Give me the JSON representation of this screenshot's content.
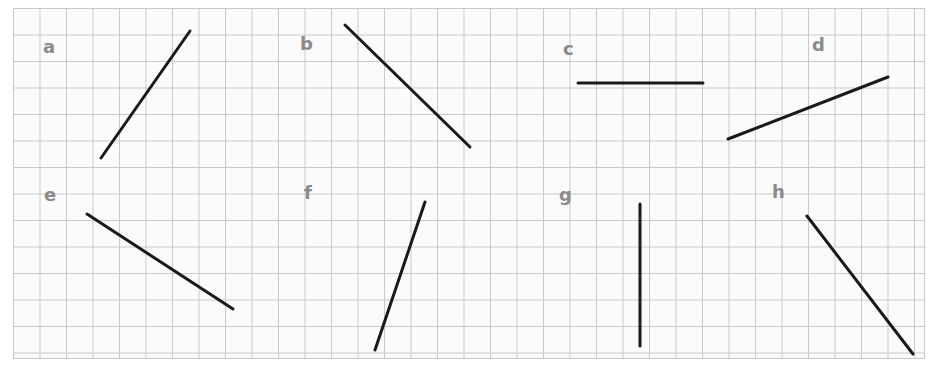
{
  "worksheet": {
    "title": "",
    "style": {
      "page_background": "#ffffff",
      "grid_background": "#fbfbfb",
      "grid_line_color": "#c9c9c9",
      "grid_cell_px": 26.5,
      "line_color": "#1a1a1a",
      "line_width_px": 3,
      "label_color": "#8a8a8a"
    },
    "frame": {
      "x": 13,
      "y": 8,
      "width": 912,
      "height": 351
    }
  },
  "chart_data": {
    "type": "scatter",
    "title": "",
    "xlabel": "",
    "ylabel": "",
    "grid": true,
    "legend": "none",
    "segments": [
      {
        "label": "a",
        "x1": 101,
        "y1": 158,
        "x2": 190,
        "y2": 31,
        "label_x": 43,
        "label_y": 38,
        "orientation": "diagonal-up-right",
        "slope": -1.43
      },
      {
        "label": "b",
        "x1": 345,
        "y1": 25,
        "x2": 470,
        "y2": 147,
        "label_x": 300,
        "label_y": 35,
        "orientation": "diagonal-down-right",
        "slope": 0.98
      },
      {
        "label": "c",
        "x1": 578,
        "y1": 83,
        "x2": 703,
        "y2": 83,
        "label_x": 563,
        "label_y": 40,
        "orientation": "horizontal",
        "slope": 0
      },
      {
        "label": "d",
        "x1": 728,
        "y1": 139,
        "x2": 888,
        "y2": 77,
        "label_x": 812,
        "label_y": 36,
        "orientation": "diagonal-up-right",
        "slope": -0.39
      },
      {
        "label": "e",
        "x1": 87,
        "y1": 214,
        "x2": 233,
        "y2": 309,
        "label_x": 44,
        "label_y": 186,
        "orientation": "diagonal-down-right",
        "slope": 0.65
      },
      {
        "label": "f",
        "x1": 375,
        "y1": 350,
        "x2": 425,
        "y2": 202,
        "label_x": 304,
        "label_y": 184,
        "orientation": "steep-up-right",
        "slope": -2.96
      },
      {
        "label": "g",
        "x1": 640,
        "y1": 204,
        "x2": 640,
        "y2": 346,
        "label_x": 559,
        "label_y": 186,
        "orientation": "vertical",
        "slope": null
      },
      {
        "label": "h",
        "x1": 807,
        "y1": 216,
        "x2": 913,
        "y2": 354,
        "label_x": 772,
        "label_y": 183,
        "orientation": "diagonal-down-right",
        "slope": 1.3
      }
    ]
  }
}
